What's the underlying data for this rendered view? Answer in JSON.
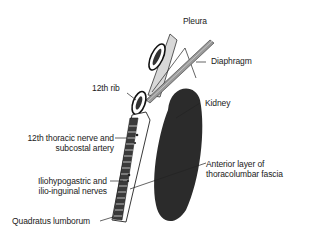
{
  "diagram": {
    "type": "anatomical cross-section",
    "labels": {
      "pleura": "Pleura",
      "diaphragm": "Diaphragm",
      "rib12": "12th rib",
      "kidney": "Kidney",
      "thoracic_nerve_line1": "12th thoracic nerve and",
      "thoracic_nerve_line2": "subcostal artery",
      "anterior_layer_line1": "Anterior layer of",
      "anterior_layer_line2": "thoracolumbar fascia",
      "iliohypogastric_line1": "Iliohypogastric and",
      "iliohypogastric_line2": "ilio-inguinal nerves",
      "quadratus": "Quadratus lumborum"
    },
    "colors": {
      "kidney": "#2b2b2b",
      "muscle": "#3a3a3a",
      "diaphragm": "#9a9a9a",
      "line": "#222222",
      "background": "#ffffff"
    }
  }
}
